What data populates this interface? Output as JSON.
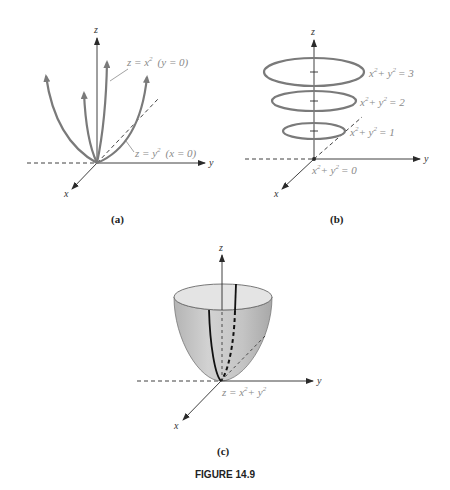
{
  "figure": {
    "title": "FIGURE 14.9",
    "colors": {
      "curve": "#7a7a7a",
      "axis": "#2a2a2a",
      "label": "#8a8a8a",
      "surface_fill": "#c8c8c8",
      "surface_rim": "#e6e6e6"
    }
  },
  "panels": [
    {
      "id": "a",
      "label": "(a)",
      "axes": {
        "x": "x",
        "y": "y",
        "z": "z"
      },
      "annotations": [
        {
          "eq_base": "z = x",
          "exp": "2",
          "cond": "(y = 0)"
        },
        {
          "eq_base": "z = y",
          "exp": "2",
          "cond": "(x = 0)"
        }
      ]
    },
    {
      "id": "b",
      "label": "(b)",
      "axes": {
        "x": "x",
        "y": "y",
        "z": "z"
      },
      "level_curves": [
        {
          "lhs_x": "x",
          "lhs_y": "+ y",
          "exp": "2",
          "value": "= 3"
        },
        {
          "lhs_x": "x",
          "lhs_y": "+ y",
          "exp": "2",
          "value": "= 2"
        },
        {
          "lhs_x": "x",
          "lhs_y": "+ y",
          "exp": "2",
          "value": "= 1"
        },
        {
          "lhs_x": "x",
          "lhs_y": "+ y",
          "exp": "2",
          "value": "= 0"
        }
      ]
    },
    {
      "id": "c",
      "label": "(c)",
      "axes": {
        "x": "x",
        "y": "y",
        "z": "z"
      },
      "surface": {
        "eq_base": "z = x",
        "exp": "2",
        "plus": "+ y",
        "exp2": "2"
      }
    }
  ]
}
